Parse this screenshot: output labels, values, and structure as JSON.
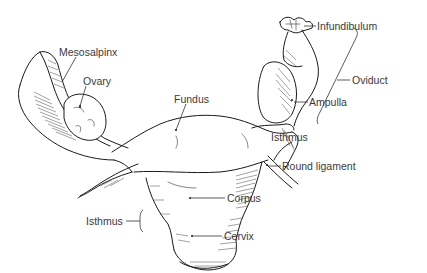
{
  "diagram": {
    "labels": {
      "mesosalpinx": "Mesosalpinx",
      "ovary": "Ovary",
      "fundus": "Fundus",
      "infundibulum": "Infundibulum",
      "ampulla": "Ampulla",
      "oviduct": "Oviduct",
      "isthmus_tube": "Isthmus",
      "round_ligament": "Round ligament",
      "corpus": "Corpus",
      "isthmus_uterus": "Isthmus",
      "cervix": "Cervix"
    },
    "colors": {
      "line": "#1a1a1a",
      "label_text": "#3a3a3a",
      "background": "#ffffff"
    }
  }
}
